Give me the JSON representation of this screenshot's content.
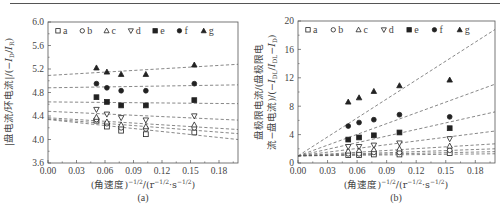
{
  "chart_data": [
    {
      "id": "a",
      "type": "scatter",
      "caption": "(a)",
      "xlabel": "(角速度)^-1/2/(r^-1/2·s^-1/2)",
      "ylabel": "|盘电流/环电流|/(−I_D/I_R)",
      "xlim": [
        0,
        0.2
      ],
      "ylim": [
        3.6,
        6.0
      ],
      "xticks": [
        "0.00",
        "0.03",
        "0.06",
        "0.09",
        "0.12",
        "0.15",
        "0.18"
      ],
      "yticks": [
        "3.6",
        "4.0",
        "4.4",
        "4.8",
        "5.2",
        "5.6",
        "6.0"
      ],
      "x": [
        0.051,
        0.062,
        0.077,
        0.103,
        0.154
      ],
      "legend_position": "top inside",
      "series": [
        {
          "name": "a",
          "marker": "open-square",
          "values": [
            4.32,
            4.22,
            4.15,
            4.09,
            4.12
          ],
          "fit": [
            4.34,
            4.0
          ]
        },
        {
          "name": "b",
          "marker": "open-circle",
          "values": [
            4.34,
            4.27,
            4.2,
            4.18,
            4.2
          ],
          "fit": [
            4.35,
            4.1
          ]
        },
        {
          "name": "c",
          "marker": "open-triangle-up",
          "values": [
            4.38,
            4.3,
            4.25,
            4.22,
            4.25
          ],
          "fit": [
            4.37,
            4.17
          ]
        },
        {
          "name": "d",
          "marker": "open-triangle-down",
          "values": [
            4.51,
            4.43,
            4.37,
            4.33,
            4.4
          ],
          "fit": [
            4.48,
            4.33
          ]
        },
        {
          "name": "e",
          "marker": "filled-square",
          "values": [
            4.72,
            4.64,
            4.58,
            4.58,
            4.67
          ],
          "fit": [
            4.64,
            4.61
          ]
        },
        {
          "name": "f",
          "marker": "filled-circle",
          "values": [
            4.95,
            4.88,
            4.83,
            4.83,
            4.95
          ],
          "fit": [
            4.88,
            4.93
          ]
        },
        {
          "name": "g",
          "marker": "filled-triangle-up",
          "values": [
            5.22,
            5.15,
            5.11,
            5.11,
            5.27
          ],
          "fit": [
            5.09,
            5.28
          ]
        }
      ]
    },
    {
      "id": "b",
      "type": "scatter",
      "caption": "(b)",
      "xlabel": "(角速度)^-1/2/(r^-1/2·s^-1/2)",
      "ylabel": "盘极限电流/(盘极限电流−盘电流)/(−I_DL/I_DL−I_D)",
      "xlim": [
        0,
        0.2
      ],
      "ylim": [
        0,
        20
      ],
      "xticks": [
        "0.00",
        "0.03",
        "0.06",
        "0.09",
        "0.12",
        "0.15",
        "0.18"
      ],
      "yticks": [
        "0",
        "4",
        "8",
        "12",
        "16",
        "20"
      ],
      "x": [
        0.051,
        0.062,
        0.077,
        0.103,
        0.154
      ],
      "legend_position": "top inside",
      "series": [
        {
          "name": "a",
          "marker": "open-square",
          "values": [
            1.1,
            1.1,
            1.2,
            1.2,
            1.4
          ],
          "fit": [
            1.0,
            1.3
          ]
        },
        {
          "name": "b",
          "marker": "open-circle",
          "values": [
            1.3,
            1.3,
            1.5,
            1.5,
            1.8
          ],
          "fit": [
            1.0,
            1.6
          ]
        },
        {
          "name": "c",
          "marker": "open-triangle-up",
          "values": [
            1.7,
            1.8,
            1.9,
            2.0,
            2.4
          ],
          "fit": [
            1.0,
            2.0
          ]
        },
        {
          "name": "d",
          "marker": "open-triangle-down",
          "values": [
            2.3,
            2.3,
            2.5,
            2.8,
            3.4
          ],
          "fit": [
            1.0,
            2.7
          ]
        },
        {
          "name": "e",
          "marker": "filled-square",
          "values": [
            3.3,
            3.6,
            3.9,
            4.3,
            4.9
          ],
          "fit": [
            1.0,
            4.5
          ]
        },
        {
          "name": "f",
          "marker": "filled-circle",
          "values": [
            5.2,
            5.7,
            6.1,
            6.8,
            6.5
          ],
          "fit": [
            1.0,
            7.2
          ]
        },
        {
          "name": "g",
          "marker": "filled-triangle-up",
          "values": [
            8.6,
            9.2,
            10.1,
            10.9,
            11.7
          ],
          "fit": [
            1.0,
            11.1
          ]
        },
        {
          "name": "g-steep",
          "marker": "none",
          "values": [],
          "fit": [
            1.0,
            18.8
          ]
        }
      ]
    }
  ],
  "legend": [
    "a",
    "b",
    "c",
    "d",
    "e",
    "f",
    "g"
  ],
  "captions": {
    "a": "(a)",
    "b": "(b)"
  },
  "xlabel_text": {
    "prefix": "(角速度)",
    "exp1": "−1/2",
    "mid": "/(r",
    "exp2": "−1/2",
    "dot": "·s",
    "exp3": "−1/2",
    "suffix": ")"
  },
  "ylabel_a": {
    "text1": "|盘电流/环电流|/(−",
    "i1": "I",
    "s1": "D",
    "slash": "/",
    "i2": "I",
    "s2": "R",
    "end": ")"
  },
  "ylabel_b": {
    "line1": "盘极限电流/(盘极限电",
    "line2a": "流−盘电流)/(−",
    "i1": "I",
    "s1": "DL",
    "slash": "/",
    "i2": "I",
    "s2": "DL",
    "minus": "−",
    "i3": "I",
    "s3": "D",
    "end": ")"
  }
}
